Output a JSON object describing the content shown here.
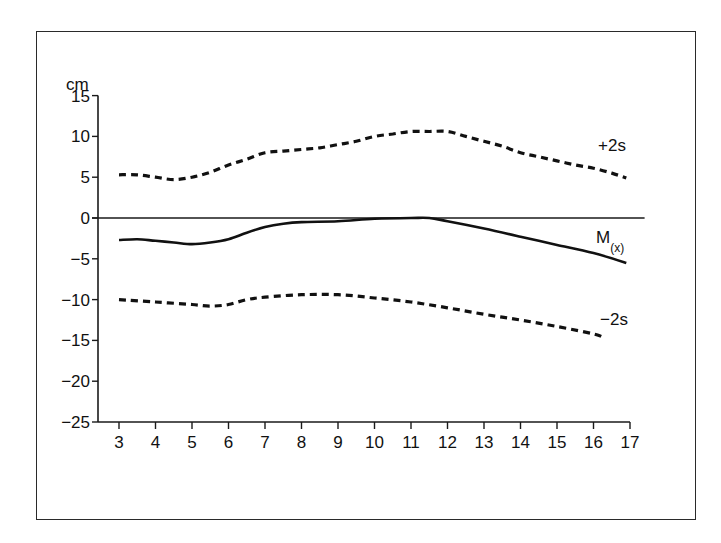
{
  "chart_data": {
    "type": "line",
    "title": "",
    "xlabel": "",
    "ylabel": "cm",
    "xlim": [
      3,
      17
    ],
    "ylim": [
      -25,
      15
    ],
    "x_ticks": [
      3,
      4,
      5,
      6,
      7,
      8,
      9,
      10,
      11,
      12,
      13,
      14,
      15,
      16,
      17
    ],
    "y_ticks": [
      15,
      10,
      5,
      0,
      -5,
      -10,
      -15,
      -20,
      -25
    ],
    "y_tick_labels": [
      "15",
      "10",
      "5",
      "0",
      "−5",
      "−10",
      "−15",
      "−20",
      "−25"
    ],
    "grid": false,
    "reference_line": {
      "y": 0,
      "style": "solid",
      "x_end": 17.4
    },
    "legend": "inline labels at right end of each series",
    "series": [
      {
        "name": "+2s",
        "label": "+2s",
        "style": "dashed",
        "x": [
          3,
          3.5,
          4,
          4.5,
          5,
          5.5,
          6,
          6.5,
          7,
          7.5,
          8,
          8.5,
          9,
          9.5,
          10,
          10.5,
          11,
          11.5,
          12,
          12.5,
          13,
          13.5,
          14,
          14.5,
          15,
          15.5,
          16,
          16.5,
          16.9
        ],
        "values": [
          5.3,
          5.3,
          5.0,
          4.7,
          5.0,
          5.6,
          6.5,
          7.2,
          8.0,
          8.2,
          8.4,
          8.6,
          9.0,
          9.4,
          10.0,
          10.3,
          10.6,
          10.6,
          10.6,
          10.0,
          9.4,
          8.8,
          8.0,
          7.5,
          7.0,
          6.5,
          6.1,
          5.5,
          4.9
        ]
      },
      {
        "name": "M(x)",
        "label": "M",
        "label_sub": "(x)",
        "style": "solid",
        "x": [
          3,
          3.5,
          4,
          4.5,
          5,
          5.5,
          6,
          6.5,
          7,
          7.5,
          8,
          9,
          10,
          11,
          11.5,
          12,
          13,
          14,
          15,
          16,
          16.9
        ],
        "values": [
          -2.7,
          -2.6,
          -2.8,
          -3.0,
          -3.2,
          -3.0,
          -2.6,
          -1.8,
          -1.1,
          -0.7,
          -0.5,
          -0.4,
          -0.1,
          0.0,
          0.0,
          -0.4,
          -1.3,
          -2.3,
          -3.3,
          -4.3,
          -5.5
        ]
      },
      {
        "name": "-2s",
        "label": "−2s",
        "style": "dashed",
        "x": [
          3,
          4,
          5,
          5.5,
          6,
          6.5,
          7,
          8,
          9,
          10,
          11,
          12,
          13,
          14,
          15,
          16,
          16.3
        ],
        "values": [
          -10.0,
          -10.3,
          -10.6,
          -10.8,
          -10.6,
          -10.0,
          -9.7,
          -9.4,
          -9.4,
          -9.8,
          -10.3,
          -11.0,
          -11.8,
          -12.5,
          -13.3,
          -14.2,
          -14.7
        ]
      }
    ]
  },
  "labels": {
    "y_unit": "cm",
    "plus2s": "+2s",
    "mean_main": "M",
    "mean_sub": "(x)",
    "minus2s": "−2s"
  }
}
